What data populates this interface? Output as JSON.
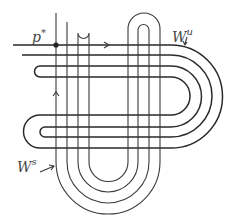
{
  "diagram": {
    "type": "stable-unstable manifold tangle (horseshoe)",
    "labels": {
      "fixed_point": "p",
      "fixed_point_sup": "*",
      "unstable_manifold": "W",
      "unstable_sup": "u",
      "stable_manifold": "W",
      "stable_sup": "s"
    },
    "arrows": {
      "unstable_direction": ">",
      "stable_direction": "^"
    },
    "colors": {
      "stroke": "#3a3a3a",
      "background": "#ffffff"
    }
  }
}
